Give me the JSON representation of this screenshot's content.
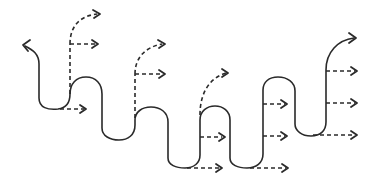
{
  "diagram": {
    "stroke_color": "#2a2a2a",
    "background": "#ffffff",
    "main_path": {
      "style": "solid",
      "start_arrow": "up-left",
      "end_arrow": "up-right"
    },
    "dashed_arrows": [
      {
        "from": [
          60,
          108
        ],
        "to": [
          86,
          108
        ],
        "kind": "straight"
      },
      {
        "from": [
          70,
          45
        ],
        "to": [
          97,
          45
        ],
        "kind": "straight"
      },
      {
        "from": [
          70,
          45
        ],
        "to": [
          100,
          14
        ],
        "kind": "curved"
      },
      {
        "from": [
          135,
          74
        ],
        "to": [
          165,
          74
        ],
        "kind": "straight"
      },
      {
        "from": [
          135,
          74
        ],
        "to": [
          165,
          44
        ],
        "kind": "curved"
      },
      {
        "from": [
          200,
          137
        ],
        "to": [
          225,
          137
        ],
        "kind": "straight"
      },
      {
        "from": [
          200,
          114
        ],
        "to": [
          228,
          73
        ],
        "kind": "curved"
      },
      {
        "from": [
          200,
          169
        ],
        "to": [
          222,
          169
        ],
        "kind": "straight"
      },
      {
        "from": [
          263,
          104
        ],
        "to": [
          287,
          104
        ],
        "kind": "straight"
      },
      {
        "from": [
          263,
          136
        ],
        "to": [
          287,
          136
        ],
        "kind": "straight"
      },
      {
        "from": [
          263,
          167
        ],
        "to": [
          288,
          167
        ],
        "kind": "straight"
      },
      {
        "from": [
          326,
          71
        ],
        "to": [
          357,
          71
        ],
        "kind": "straight"
      },
      {
        "from": [
          326,
          102
        ],
        "to": [
          357,
          102
        ],
        "kind": "straight"
      },
      {
        "from": [
          316,
          134
        ],
        "to": [
          357,
          134
        ],
        "kind": "straight"
      }
    ]
  }
}
